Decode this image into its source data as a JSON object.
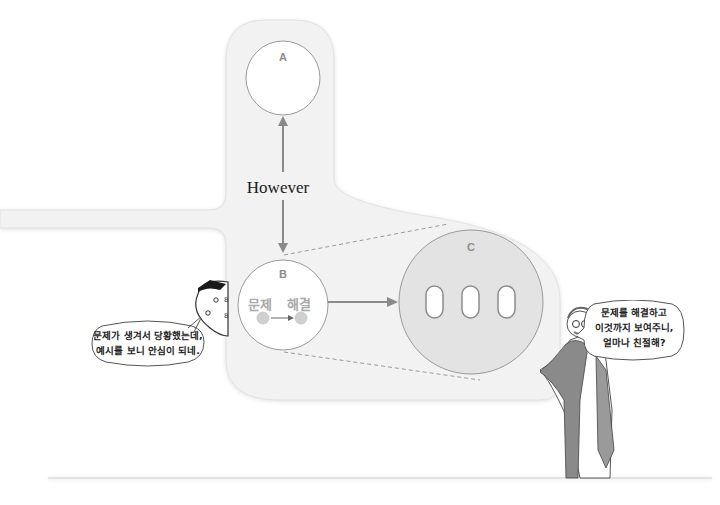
{
  "diagram": {
    "nodes": {
      "a": {
        "label": "A"
      },
      "b": {
        "label": "B",
        "from_word": "문제",
        "to_word": "해결"
      },
      "c": {
        "label": "C",
        "pill_count": 3
      }
    },
    "connector_label": "However",
    "colors": {
      "panel": "#f2f2f2",
      "circle_stroke": "#9a9a9a",
      "arrow": "#8a8a8a",
      "c_fill": "#e3e3e3",
      "dot": "#cfcfcf"
    }
  },
  "characters": {
    "left": {
      "name": "student-character",
      "speech": [
        "문제가 생겨서 당황했는데,",
        "예시를 보니 안심이 되네."
      ]
    },
    "right": {
      "name": "teacher-character",
      "speech": [
        "문제를 해결하고",
        "이것까지 보여주니,",
        "얼마나 친절해?"
      ]
    }
  }
}
